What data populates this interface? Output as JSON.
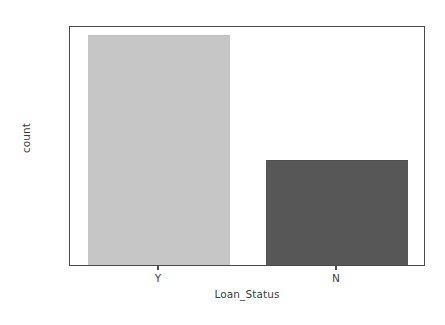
{
  "chart_data": {
    "type": "bar",
    "title": "",
    "subtitle": "",
    "xlabel": "Loan_Status",
    "ylabel": "count",
    "categories": [
      "Y",
      "N"
    ],
    "values": [
      419,
      192
    ],
    "series": [
      {
        "name": "count",
        "values": [
          419,
          192
        ]
      }
    ],
    "ylim": [
      0,
      437
    ],
    "yticks": [
      0,
      50,
      100,
      150,
      200,
      250,
      300,
      350,
      400
    ],
    "ytick_labels": [
      "0",
      "50",
      "100",
      "150",
      "200",
      "250",
      "300",
      "350",
      "400"
    ],
    "xtick_labels": [
      "Y",
      "N"
    ],
    "grid": false,
    "legend": null,
    "legend_position": "none",
    "bar_colors": [
      "#c6c6c6",
      "#575757"
    ],
    "bar_edge_colors": [
      "#bdbdbd",
      "#4f4f4f"
    ],
    "axis_color": "#4a4a4a",
    "text_color": "#3c3c3c",
    "background": "#ffffff",
    "bar_width_fraction": 0.8,
    "annotations": []
  }
}
